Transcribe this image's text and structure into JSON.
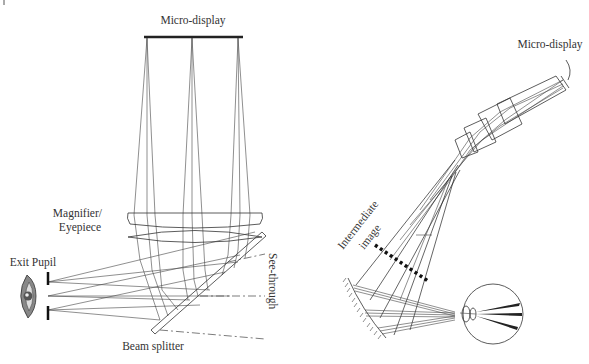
{
  "figure": {
    "left_diagram": {
      "title": "Conventional see-through HMD with beam splitter",
      "labels": {
        "micro_display": "Micro-display",
        "magnifier_line1": "Magnifier/",
        "magnifier_line2": "Eyepiece",
        "exit_pupil": "Exit Pupil",
        "see_through": "See-through",
        "beam_splitter": "Beam splitter"
      }
    },
    "right_diagram": {
      "title": "Relay optics HMD with intermediate image",
      "labels": {
        "micro_display": "Micro-display",
        "intermediate_line1": "Intermediate",
        "intermediate_line2": "image"
      }
    },
    "colors": {
      "line": "#333333",
      "background": "#ffffff"
    }
  }
}
